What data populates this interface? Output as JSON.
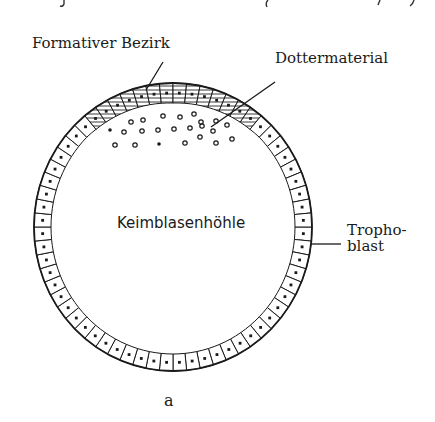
{
  "figure": {
    "panel_label": "a",
    "labels": {
      "formative_region": "Formativer Bezirk",
      "yolk_material": "Dottermaterial",
      "blastocoel": "Keimblasenhöhle",
      "trophoblast_line1": "Tropho-",
      "trophoblast_line2": "blast"
    },
    "colors": {
      "ink": "#1a1a1a",
      "shading": "#8a8a8a",
      "background": "#ffffff"
    }
  }
}
